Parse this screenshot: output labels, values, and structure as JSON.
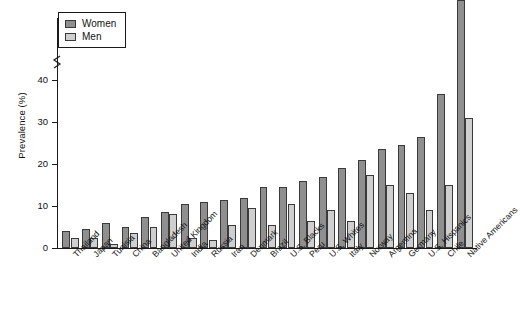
{
  "chart_data": {
    "type": "bar",
    "title": "",
    "xlabel": "",
    "ylabel": "Prevalence (%)",
    "ylim": [
      0,
      45
    ],
    "yticks": [
      0,
      10,
      20,
      30,
      40
    ],
    "ytick_labels": [
      "0",
      "10",
      "20",
      "30",
      "40"
    ],
    "grid": false,
    "axis_break": true,
    "axis_break_note": "y-axis broken above 40; tallest bar drawn past break",
    "legend_position": "top-left",
    "categories": [
      "Thailand",
      "Japan",
      "Tunisia",
      "China",
      "Bangladesh",
      "United Kingdom",
      "India",
      "Russia",
      "Iran",
      "Denmark",
      "Brazil",
      "U.S. Blacks",
      "Peru",
      "U.S. Whites",
      "Italy",
      "Norway",
      "Argentina",
      "Germany",
      "U.S. Hispanics",
      "Chile",
      "Native Americans"
    ],
    "series": [
      {
        "name": "Women",
        "color": "#8f8f8f",
        "values": [
          4.0,
          4.5,
          6.0,
          5.0,
          7.5,
          8.5,
          10.5,
          11.0,
          11.5,
          12.0,
          14.5,
          14.5,
          16.0,
          17.0,
          19.0,
          21.0,
          23.5,
          24.5,
          26.5,
          36.7,
          65.6
        ]
      },
      {
        "name": "Men",
        "color": "#cfcfcf",
        "values": [
          2.5,
          2.5,
          1.0,
          3.5,
          5.0,
          8.0,
          2.5,
          2.0,
          5.5,
          9.5,
          5.5,
          10.5,
          6.5,
          9.0,
          6.5,
          17.5,
          15.0,
          13.0,
          9.0,
          15.0,
          31.0
        ]
      }
    ],
    "annotations": [
      {
        "series": "Women",
        "category": "Native Americans",
        "label": "65.6"
      }
    ]
  },
  "legend": {
    "items": [
      {
        "label": "Women",
        "swatch": "women-swatch"
      },
      {
        "label": "Men",
        "swatch": "men-swatch"
      }
    ]
  },
  "caption": ""
}
